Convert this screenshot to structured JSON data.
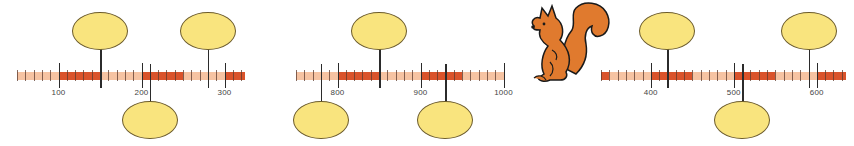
{
  "colors": {
    "light_segment": "#f6c3a2",
    "dark_segment": "#d9532b",
    "bubble_fill": "#f9e47e",
    "bubble_stroke": "#6b5a2a",
    "tick": "#2b2b2b",
    "label": "#444444",
    "squirrel_fill": "#e07a2e"
  },
  "number_lines": [
    {
      "id": "line-1",
      "start_value": 50,
      "end_value": 325,
      "x_at_start": 17,
      "px_per_unit": 0.83,
      "minor_step": 10,
      "major_step": 100,
      "labels": [
        "100",
        "200",
        "300"
      ],
      "label_values": [
        100,
        200,
        300
      ],
      "dark_ranges": [
        [
          100,
          150
        ],
        [
          200,
          250
        ],
        [
          300,
          325
        ]
      ],
      "pointers": [
        {
          "value": 150,
          "position": "top"
        },
        {
          "value": 210,
          "position": "bottom"
        },
        {
          "value": 280,
          "position": "top"
        }
      ]
    },
    {
      "id": "line-2",
      "start_value": 750,
      "end_value": 1000,
      "x_at_start": 296,
      "px_per_unit": 0.83,
      "minor_step": 10,
      "major_step": 100,
      "labels": [
        "800",
        "900",
        "1000"
      ],
      "label_values": [
        800,
        900,
        1000
      ],
      "dark_ranges": [
        [
          800,
          850
        ],
        [
          900,
          950
        ]
      ],
      "pointers": [
        {
          "value": 780,
          "position": "bottom"
        },
        {
          "value": 850,
          "position": "top"
        },
        {
          "value": 930,
          "position": "bottom"
        }
      ]
    },
    {
      "id": "line-3",
      "start_value": 340,
      "end_value": 635,
      "x_at_start": 601,
      "px_per_unit": 0.83,
      "minor_step": 10,
      "major_step": 100,
      "labels": [
        "400",
        "500",
        "600"
      ],
      "label_values": [
        400,
        500,
        600
      ],
      "dark_ranges": [
        [
          340,
          350
        ],
        [
          400,
          450
        ],
        [
          500,
          550
        ],
        [
          600,
          635
        ]
      ],
      "pointers": [
        {
          "value": 420,
          "position": "top"
        },
        {
          "value": 510,
          "position": "bottom"
        },
        {
          "value": 590,
          "position": "top"
        }
      ]
    }
  ],
  "illustration": {
    "icon": "squirrel-icon"
  }
}
